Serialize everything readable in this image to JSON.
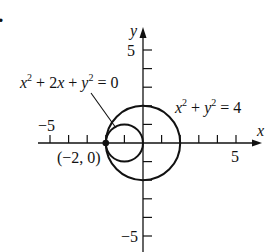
{
  "problem_marker": ".",
  "axes": {
    "x_label": "x",
    "y_label": "y",
    "x_tick_label_neg": "−5",
    "x_tick_label_pos": "5",
    "y_tick_label_pos": "5",
    "y_tick_label_neg": "−5"
  },
  "curves": [
    {
      "equation_name": "small-circle",
      "lhs_a": "x",
      "sup1": "2",
      "mid": " + 2",
      "lhs_b": "x",
      "plus": " + ",
      "lhs_c": "y",
      "sup2": "2",
      "rhs": " = 0",
      "center": [
        -1,
        0
      ],
      "radius": 1
    },
    {
      "equation_name": "large-circle",
      "lhs_a": "x",
      "sup1": "2",
      "plus": " + ",
      "lhs_c": "y",
      "sup2": "2",
      "rhs": " = 4",
      "center": [
        0,
        0
      ],
      "radius": 2
    }
  ],
  "point": {
    "label": "(−2, 0)",
    "coords": [
      -2,
      0
    ]
  },
  "colors": {
    "ink": "#111111",
    "background": "#ffffff"
  }
}
